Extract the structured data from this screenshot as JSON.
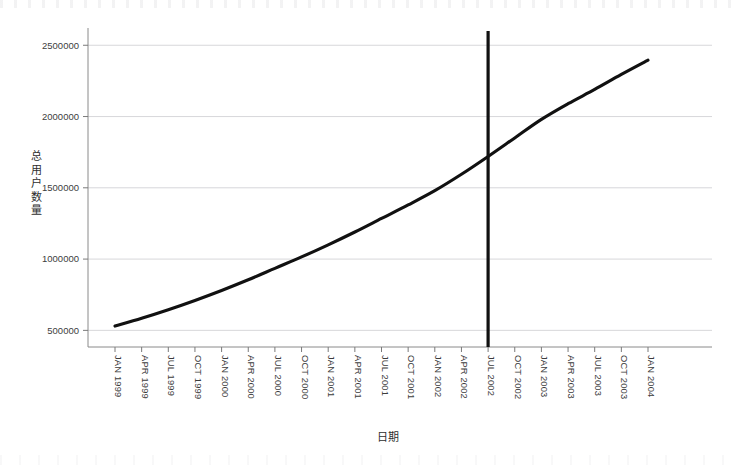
{
  "chart_data": {
    "type": "line",
    "title": "",
    "xlabel": "日期",
    "ylabel": "总用户数量",
    "grid": true,
    "legend": "none",
    "xlim": [
      "JAN 1999",
      "JAN 2004"
    ],
    "ylim": [
      250000,
      2600000
    ],
    "yticks": [
      500000,
      1000000,
      1500000,
      2000000,
      2500000
    ],
    "ytick_labels": [
      "500000",
      "1000000",
      "1500000",
      "2000000",
      "2500000"
    ],
    "categories": [
      "JAN 1999",
      "APR 1999",
      "JUL 1999",
      "OCT 1999",
      "JAN 2000",
      "APR 2000",
      "JUL 2000",
      "OCT 2000",
      "JAN 2001",
      "APR 2001",
      "JUL 2001",
      "OCT 2001",
      "JAN 2002",
      "APR 2002",
      "JUL 2002",
      "OCT 2002",
      "JAN 2003",
      "APR 2003",
      "JUL 2003",
      "OCT 2003",
      "JAN 2004"
    ],
    "series": [
      {
        "name": "总用户数量",
        "color": "#111111",
        "values": [
          530000,
          585000,
          645000,
          710000,
          780000,
          855000,
          935000,
          1015000,
          1100000,
          1190000,
          1285000,
          1380000,
          1480000,
          1595000,
          1720000,
          1850000,
          1980000,
          2090000,
          2190000,
          2295000,
          2395000
        ]
      }
    ],
    "annotations": [
      {
        "name": "vertical-marker",
        "type": "vline",
        "at_category": "JUL 2002",
        "value": 2600000,
        "color": "#111111"
      }
    ]
  },
  "axis": {
    "y_title": "总用户数量",
    "y_title_chars": [
      "总",
      "用",
      "户",
      "数",
      "量"
    ],
    "x_title": "日期"
  }
}
